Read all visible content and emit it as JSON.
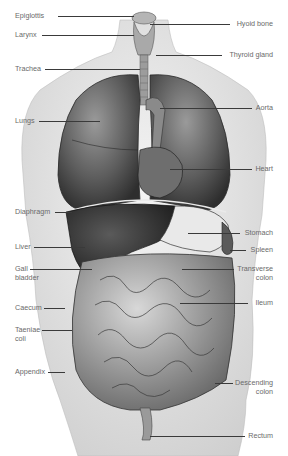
{
  "figure": {
    "background": "#ffffff",
    "ink": "#3a3a3a",
    "label_color": "#6a6a6a"
  },
  "labels_left": [
    {
      "text": "Epiglottis",
      "x": 15,
      "y": 11,
      "line_to": 134
    },
    {
      "text": "Larynx",
      "x": 15,
      "y": 30,
      "line_to": 134
    },
    {
      "text": "Trachea",
      "x": 15,
      "y": 64,
      "line_to": 138
    },
    {
      "text": "Lungs",
      "x": 15,
      "y": 116,
      "line_to": 100
    },
    {
      "text": "Diaphragm",
      "x": 15,
      "y": 207,
      "line_to": 72
    },
    {
      "text": "Liver",
      "x": 15,
      "y": 242,
      "line_to": 85
    },
    {
      "text": "Gall",
      "text2": "bladder",
      "x": 15,
      "y": 264,
      "line_to": 92
    },
    {
      "text": "Caecum",
      "x": 15,
      "y": 303,
      "line_to": 65
    },
    {
      "text": "Taeniae",
      "text2": "coli",
      "x": 15,
      "y": 325,
      "line_to": 72
    },
    {
      "text": "Appendix",
      "x": 15,
      "y": 367,
      "line_to": 65
    }
  ],
  "labels_right": [
    {
      "text": "Hyoid bone",
      "x": 273,
      "y": 19,
      "line_from": 150
    },
    {
      "text": "Thyroid gland",
      "x": 273,
      "y": 50,
      "line_from": 156
    },
    {
      "text": "Aorta",
      "x": 273,
      "y": 103,
      "line_from": 160
    },
    {
      "text": "Heart",
      "x": 273,
      "y": 164,
      "line_from": 170
    },
    {
      "text": "Stomach",
      "x": 273,
      "y": 228,
      "line_from": 188
    },
    {
      "text": "Spleen",
      "x": 273,
      "y": 245,
      "line_from": 230
    },
    {
      "text": "Transverse",
      "text2": "colon",
      "x": 273,
      "y": 264,
      "line_from": 182
    },
    {
      "text": "Ileum",
      "x": 273,
      "y": 298,
      "line_from": 180
    },
    {
      "text": "Descending",
      "text2": "colon",
      "x": 273,
      "y": 378,
      "line_from": 215
    },
    {
      "text": "Rectum",
      "x": 273,
      "y": 431,
      "line_from": 150
    }
  ]
}
